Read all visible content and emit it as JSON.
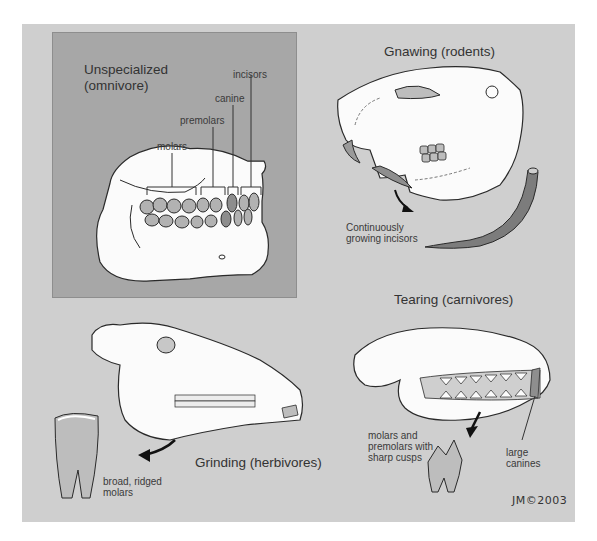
{
  "figure": {
    "panels": {
      "omnivore": {
        "title_line1": "Unspecialized",
        "title_line2": "(omnivore)",
        "labels": {
          "incisors": "incisors",
          "canine": "canine",
          "premolars": "premolars",
          "molars": "molars"
        }
      },
      "rodent": {
        "title": "Gnawing (rodents)",
        "caption_line1": "Continuously",
        "caption_line2": "growing incisors"
      },
      "herbivore": {
        "title": "Grinding (herbivores)",
        "caption_line1": "broad, ridged",
        "caption_line2": "molars"
      },
      "carnivore": {
        "title": "Tearing (carnivores)",
        "caption_line1": "molars and",
        "caption_line2": "premolars with",
        "caption_line3": "sharp cusps",
        "canine_line1": "large",
        "canine_line2": "canines"
      }
    },
    "signature": "JM©2003",
    "colors": {
      "panel_bg": "#cfcfcf",
      "inset_bg": "#a7a7a7",
      "bone": "#fbfbfb",
      "tooth": "#9a9a9a",
      "outline": "#222222"
    }
  }
}
